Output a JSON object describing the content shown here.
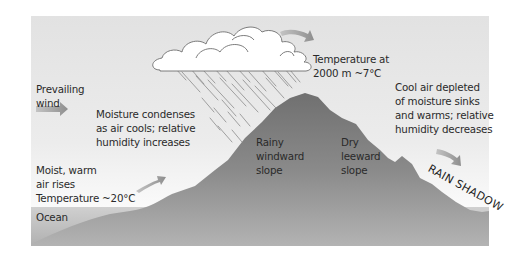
{
  "diagram": {
    "colors": {
      "sky": "#e4e4e4",
      "sky_light": "#f8f8f8",
      "mountain": "#7e7e7e",
      "mountain_dark": "#6f6f6f",
      "ocean": "#b5b5b5",
      "cloud": "#ffffff",
      "arrow": "#9a9a9a",
      "text": "#2a2a2a"
    },
    "labels": {
      "prevailing_wind": [
        "Prevailing",
        "wind"
      ],
      "moisture_condenses": [
        "Moisture condenses",
        "as air cools; relative",
        "humidity increases"
      ],
      "temperature_at_altitude": [
        "Temperature at",
        "2000 m ~7°C"
      ],
      "cool_air_sinks": [
        "Cool air depleted",
        "of moisture sinks",
        "and warms; relative",
        "humidity decreases"
      ],
      "rainy_windward": [
        "Rainy",
        "windward",
        "slope"
      ],
      "dry_leeward": [
        "Dry",
        "leeward",
        "slope"
      ],
      "moist_warm_air": [
        "Moist, warm",
        "air rises",
        "Temperature ~20°C"
      ],
      "ocean": "Ocean",
      "rain_shadow": "RAIN SHADOW"
    },
    "arrows": [
      {
        "name": "prevailing-wind-arrow",
        "direction": "right"
      },
      {
        "name": "rising-air-arrow",
        "direction": "up-right"
      },
      {
        "name": "over-peak-arrow",
        "direction": "right-curved"
      },
      {
        "name": "sinking-air-arrow",
        "direction": "down-right"
      }
    ]
  }
}
